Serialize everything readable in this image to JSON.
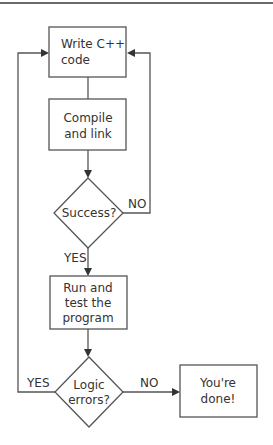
{
  "diagram": {
    "type": "flowchart",
    "nodes": [
      {
        "id": "write",
        "shape": "rect",
        "lines": [
          "Write C++",
          "code"
        ]
      },
      {
        "id": "compile",
        "shape": "rect",
        "lines": [
          "Compile",
          "and link"
        ]
      },
      {
        "id": "success",
        "shape": "diamond",
        "lines": [
          "Success?"
        ]
      },
      {
        "id": "run",
        "shape": "rect",
        "lines": [
          "Run and",
          "test the",
          "program"
        ]
      },
      {
        "id": "logic",
        "shape": "diamond",
        "lines": [
          "Logic",
          "errors?"
        ]
      },
      {
        "id": "done",
        "shape": "rect",
        "lines": [
          "You're",
          "done!"
        ]
      }
    ],
    "edges": [
      {
        "from": "write",
        "to": "compile",
        "label": ""
      },
      {
        "from": "compile",
        "to": "success",
        "label": ""
      },
      {
        "from": "success",
        "to": "write",
        "label": "NO"
      },
      {
        "from": "success",
        "to": "run",
        "label": "YES"
      },
      {
        "from": "run",
        "to": "logic",
        "label": ""
      },
      {
        "from": "logic",
        "to": "write",
        "label": "YES"
      },
      {
        "from": "logic",
        "to": "done",
        "label": "NO"
      }
    ],
    "edge_labels": {
      "success_no": "NO",
      "success_yes": "YES",
      "logic_yes": "YES",
      "logic_no": "NO"
    },
    "colors": {
      "stroke": "#555555",
      "text": "#333333",
      "background": "#ffffff",
      "rule": "#6a6a6a"
    }
  }
}
